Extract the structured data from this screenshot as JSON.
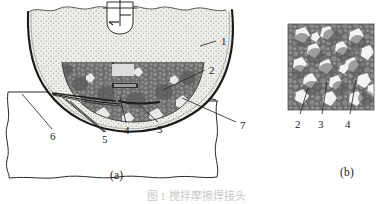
{
  "figure": {
    "caption": "图 1  搅拌摩擦焊接头",
    "panels": [
      {
        "id": "a",
        "label": "(a)",
        "description": "weld cross-section schematic with tool and nugget zone"
      },
      {
        "id": "b",
        "label": "(b)",
        "description": "micrograph of nugget zone microstructure"
      }
    ]
  },
  "panel_a": {
    "label": "(a)",
    "callouts": [
      {
        "id": "1",
        "label": "1",
        "x": 222,
        "y": 43
      },
      {
        "id": "2",
        "label": "2",
        "x": 210,
        "y": 72
      },
      {
        "id": "3",
        "label": "3",
        "x": 160,
        "y": 130
      },
      {
        "id": "4",
        "label": "4",
        "x": 127,
        "y": 131
      },
      {
        "id": "5",
        "label": "5",
        "x": 105,
        "y": 140
      },
      {
        "id": "6",
        "label": "6",
        "x": 53,
        "y": 137
      },
      {
        "id": "7",
        "label": "7",
        "x": 241,
        "y": 126
      }
    ],
    "regions": [
      {
        "name": "stir-tool-symbol",
        "tone": "#ffffff"
      },
      {
        "name": "upper-stippled-body",
        "tone": "#e9e9e6"
      },
      {
        "name": "nugget-zone",
        "tone": "#6f6f6f"
      },
      {
        "name": "base-plate",
        "tone": "#ffffff"
      }
    ]
  },
  "panel_b": {
    "label": "(b)",
    "callouts": [
      {
        "id": "2",
        "label": "2",
        "x": 14,
        "y": 100
      },
      {
        "id": "3",
        "label": "3",
        "x": 38,
        "y": 100
      },
      {
        "id": "4",
        "label": "4",
        "x": 65,
        "y": 100
      }
    ],
    "micrograph": {
      "name": "nugget-microstructure",
      "matrix_tone": "#6e6e6e",
      "grain_tone": "#8d8d8d",
      "void_tone": "#f2f2f2"
    }
  },
  "colors": {
    "ink": "#1b1b1b",
    "line": "#2a2a2a",
    "stipple": "#e9e9e6",
    "nugget_dark": "#6f6f6f",
    "nugget_mid": "#8c8c8c",
    "micro_bg": "#707070",
    "paper": "#ffffff"
  }
}
